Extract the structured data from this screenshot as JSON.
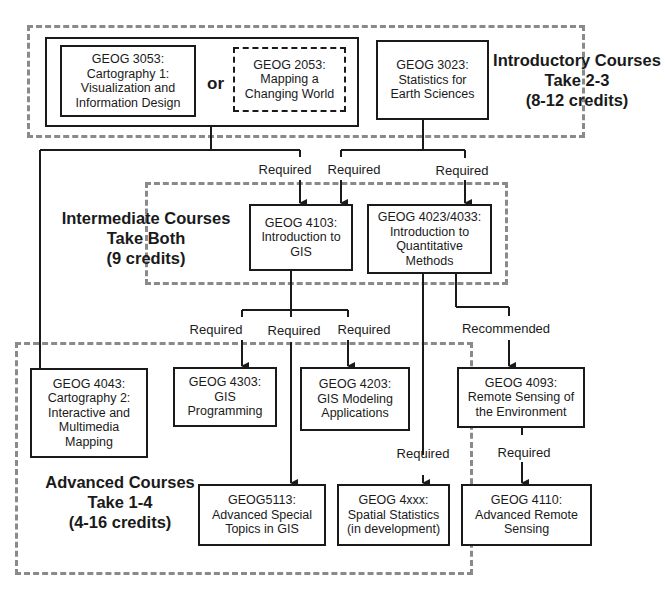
{
  "diagram": {
    "type": "course-prerequisite-flowchart",
    "colors": {
      "line": "#1a1a1a",
      "group_border": "#8a8a8a",
      "background": "#ffffff"
    }
  },
  "sections": {
    "introductory": {
      "title": "Introductory Courses",
      "rule": "Take 2-3",
      "credits": "(8-12 credits)"
    },
    "intermediate": {
      "title": "Intermediate Courses",
      "rule": "Take Both",
      "credits": "(9 credits)"
    },
    "advanced": {
      "title": "Advanced Courses",
      "rule": "Take 1-4",
      "credits": "(4-16 credits)"
    }
  },
  "or_label": "or",
  "courses": {
    "geog3053": {
      "code": "GEOG 3053:",
      "lines": [
        "Cartography 1:",
        "Visualization and",
        "Information Design"
      ]
    },
    "geog2053": {
      "code": "GEOG 2053:",
      "lines": [
        "Mapping a",
        "Changing World"
      ]
    },
    "geog3023": {
      "code": "GEOG 3023:",
      "lines": [
        "Statistics for",
        "Earth Sciences"
      ]
    },
    "geog4103": {
      "code": "GEOG 4103:",
      "lines": [
        "Introduction to",
        "GIS"
      ]
    },
    "geog4023": {
      "code": "GEOG 4023/4033:",
      "lines": [
        "Introduction to",
        "Quantitative",
        "Methods"
      ]
    },
    "geog4043": {
      "code": "GEOG 4043:",
      "lines": [
        "Cartography 2:",
        "Interactive and",
        "Multimedia",
        "Mapping"
      ]
    },
    "geog4303": {
      "code": "GEOG 4303:",
      "lines": [
        "GIS",
        "Programming"
      ]
    },
    "geog4203": {
      "code": "GEOG 4203:",
      "lines": [
        "GIS Modeling",
        "Applications"
      ]
    },
    "geog4093": {
      "code": "GEOG 4093:",
      "lines": [
        "Remote Sensing of",
        "the Environment"
      ]
    },
    "geog5113": {
      "code": "GEOG5113:",
      "lines": [
        "Advanced Special",
        "Topics in GIS"
      ]
    },
    "geog4xxx": {
      "code": "GEOG 4xxx:",
      "lines": [
        "Spatial Statistics",
        "(in development)"
      ]
    },
    "geog4110": {
      "code": "GEOG 4110:",
      "lines": [
        "Advanced Remote",
        "Sensing"
      ]
    }
  },
  "edge_labels": {
    "cart1_to_intro_gis": "Required",
    "stats_to_intro_gis": "Required",
    "stats_to_quant": "Required",
    "gis_to_programming": "Required",
    "gis_to_special_topics": "Required",
    "gis_to_modeling": "Required",
    "quant_to_remote_sensing": "Recommended",
    "quant_to_spatial_stats": "Required",
    "remote_sensing_to_adv_rs": "Required"
  }
}
